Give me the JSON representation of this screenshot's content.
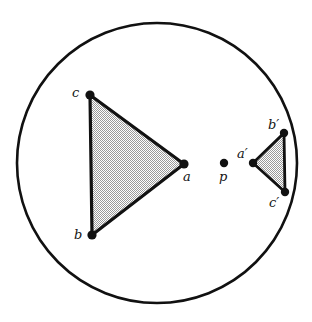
{
  "figure": {
    "type": "geometry-diagram",
    "background_color": "#ffffff",
    "stroke_color": "#111111",
    "fill_color": "#c8c8c8",
    "boundary": {
      "shape": "circle",
      "cx": 157,
      "cy": 163,
      "r": 140,
      "stroke_width": 2.6
    },
    "points": [
      {
        "id": "p",
        "label": "p",
        "x": 224,
        "y": 163,
        "label_x": 219,
        "label_y": 170,
        "dot_r": 4.2
      }
    ],
    "triangles": [
      {
        "id": "triangle-abc",
        "orientation": "points-right",
        "stroke_width": 3.2,
        "vertices": [
          {
            "id": "a",
            "label": "a",
            "x": 184,
            "y": 164,
            "label_x": 183,
            "label_y": 170,
            "dot_r": 4.6
          },
          {
            "id": "b",
            "label": "b",
            "x": 92,
            "y": 235,
            "label_x": 74,
            "label_y": 228,
            "dot_r": 4.6
          },
          {
            "id": "c",
            "label": "c",
            "x": 90,
            "y": 95,
            "label_x": 72,
            "label_y": 86,
            "dot_r": 4.6
          }
        ]
      },
      {
        "id": "triangle-abc-prime",
        "orientation": "points-left",
        "stroke_width": 2.8,
        "vertices": [
          {
            "id": "a-prime",
            "label": "a′",
            "x": 253,
            "y": 163,
            "label_x": 237,
            "label_y": 147,
            "dot_r": 4.2
          },
          {
            "id": "b-prime",
            "label": "b′",
            "x": 284,
            "y": 133,
            "label_x": 268,
            "label_y": 118,
            "dot_r": 4.2
          },
          {
            "id": "c-prime",
            "label": "c′",
            "x": 285,
            "y": 192,
            "label_x": 269,
            "label_y": 196,
            "dot_r": 4.2
          }
        ]
      }
    ]
  }
}
